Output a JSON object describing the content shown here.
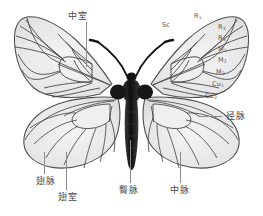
{
  "figure": {
    "background_color": "#ffffff",
    "wing_membrane_color": "#e9e9e9",
    "vein_color": "#4a4a4a",
    "body_color": "#1c1c1c",
    "label_color": "#4a4a4a",
    "leader_color": "#8c8c8c"
  },
  "labels": {
    "chinese": [
      {
        "id": "discal-cell",
        "text": "中室",
        "x": 68,
        "y": 12,
        "leader": {
          "x": 86,
          "y": 22,
          "length": 45,
          "dir": "down"
        }
      },
      {
        "id": "radial-vein",
        "text": "径脉",
        "x": 226,
        "y": 112,
        "leader": {
          "x": 200,
          "y": 116,
          "length": 22,
          "dir": "left"
        }
      },
      {
        "id": "wing-vein",
        "text": "翅脉",
        "x": 36,
        "y": 177,
        "leader": {
          "x": 44,
          "y": 152,
          "length": 22,
          "dir": "up"
        }
      },
      {
        "id": "wing-cell",
        "text": "翅室",
        "x": 58,
        "y": 193,
        "leader": {
          "x": 66,
          "y": 152,
          "length": 38,
          "dir": "up"
        }
      },
      {
        "id": "anal-vein",
        "text": "臀脉",
        "x": 119,
        "y": 186,
        "leader": {
          "x": 130,
          "y": 140,
          "length": 43,
          "dir": "up"
        }
      },
      {
        "id": "median-vein",
        "text": "中脉",
        "x": 170,
        "y": 186,
        "leader": {
          "x": 180,
          "y": 152,
          "length": 31,
          "dir": "up"
        }
      }
    ],
    "scientific": [
      {
        "id": "sc",
        "text": "Sc",
        "sub": "",
        "x": 162,
        "y": 22
      },
      {
        "id": "r1",
        "text": "R",
        "sub": "1",
        "x": 194,
        "y": 13
      },
      {
        "id": "r3",
        "text": "R",
        "sub": "3",
        "x": 218,
        "y": 24
      },
      {
        "id": "r4",
        "text": "R",
        "sub": "4",
        "x": 218,
        "y": 35
      },
      {
        "id": "m1",
        "text": "M",
        "sub": "1",
        "x": 218,
        "y": 46
      },
      {
        "id": "m2",
        "text": "M",
        "sub": "2",
        "x": 218,
        "y": 57
      },
      {
        "id": "m3",
        "text": "M",
        "sub": "3",
        "x": 216,
        "y": 69
      },
      {
        "id": "cu1",
        "text": "Cu",
        "sub": "1",
        "x": 212,
        "y": 81
      },
      {
        "id": "cu2",
        "text": "Cu",
        "sub": "2",
        "x": 205,
        "y": 93
      }
    ]
  }
}
